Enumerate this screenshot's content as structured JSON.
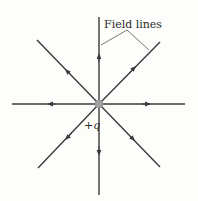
{
  "diagram": {
    "title_label": "Field lines",
    "charge_label": "+q",
    "center": {
      "x": 99,
      "y": 104
    },
    "charge_color": "#a0a0a0",
    "line_color": "#3a3a3a",
    "field_lines": [
      {
        "direction": "up",
        "x2": 99,
        "y2": 17
      },
      {
        "direction": "down",
        "x2": 99,
        "y2": 195
      },
      {
        "direction": "left",
        "x2": 12,
        "y2": 104
      },
      {
        "direction": "right",
        "x2": 185,
        "y2": 104
      },
      {
        "direction": "up-left",
        "x2": 37,
        "y2": 40
      },
      {
        "direction": "up-right",
        "x2": 160,
        "y2": 42
      },
      {
        "direction": "down-left",
        "x2": 38,
        "y2": 168
      },
      {
        "direction": "down-right",
        "x2": 160,
        "y2": 167
      }
    ]
  }
}
